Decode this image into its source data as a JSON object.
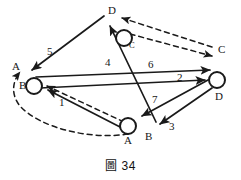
{
  "figure": {
    "caption_symbol": "圖",
    "caption_number": "34",
    "background_color": "#ffffff",
    "ink_color": "#1a1a1a"
  },
  "nodes": [
    {
      "id": "n-left",
      "label": "B",
      "secondary_label": "A",
      "x": 34,
      "y": 86,
      "r": 8
    },
    {
      "id": "n-top",
      "label": "C",
      "secondary_label": "D",
      "x": 124,
      "y": 39,
      "r": 8
    },
    {
      "id": "n-right",
      "label": "D",
      "secondary_label": "C",
      "x": 217,
      "y": 80,
      "r": 8
    },
    {
      "id": "n-bottom",
      "label": "A",
      "secondary_label": "B",
      "x": 128,
      "y": 126,
      "r": 8
    }
  ],
  "vertex_labels": [
    {
      "name": "label-A-left",
      "text": "A",
      "x": 12,
      "y": 61
    },
    {
      "name": "label-B-left",
      "text": "B",
      "x": 19,
      "y": 80
    },
    {
      "name": "label-D-top",
      "text": "D",
      "x": 108,
      "y": 5
    },
    {
      "name": "label-C-top",
      "text": "C",
      "x": 129,
      "y": 41,
      "small": true
    },
    {
      "name": "label-C-right",
      "text": "C",
      "x": 218,
      "y": 44
    },
    {
      "name": "label-D-right",
      "text": "D",
      "x": 215,
      "y": 91
    },
    {
      "name": "label-A-bottom",
      "text": "A",
      "x": 124,
      "y": 135
    },
    {
      "name": "label-B-bottom",
      "text": "B",
      "x": 145,
      "y": 131
    }
  ],
  "edge_labels": [
    {
      "name": "edge-label-5",
      "text": "5",
      "x": 47,
      "y": 46
    },
    {
      "name": "edge-label-4",
      "text": "4",
      "x": 105,
      "y": 57
    },
    {
      "name": "edge-label-6",
      "text": "6",
      "x": 148,
      "y": 59
    },
    {
      "name": "edge-label-2",
      "text": "2",
      "x": 177,
      "y": 72
    },
    {
      "name": "edge-label-7",
      "text": "7",
      "x": 152,
      "y": 94
    },
    {
      "name": "edge-label-3",
      "text": "3",
      "x": 169,
      "y": 121
    },
    {
      "name": "edge-label-1",
      "text": "1",
      "x": 59,
      "y": 97
    }
  ],
  "edges": [
    {
      "name": "edge-solid-top-to-left",
      "style": "solid",
      "weight": "5"
    },
    {
      "name": "edge-solid-bottom-to-top",
      "style": "solid",
      "weight": "4"
    },
    {
      "name": "edge-solid-left-to-right",
      "style": "solid",
      "weight": "6"
    },
    {
      "name": "edge-solid-left-to-right-2",
      "style": "solid",
      "weight": "2"
    },
    {
      "name": "edge-solid-right-to-bottom",
      "style": "solid",
      "weight": "7"
    },
    {
      "name": "edge-solid-right-to-lower",
      "style": "solid",
      "weight": "3"
    },
    {
      "name": "edge-solid-bottom-to-left",
      "style": "solid",
      "weight": "1"
    },
    {
      "name": "edge-dashed-top-to-right",
      "style": "dashed",
      "weight": ""
    },
    {
      "name": "edge-dashed-right-to-top",
      "style": "dashed",
      "weight": ""
    },
    {
      "name": "edge-dashed-bottom-to-left",
      "style": "dashed",
      "weight": ""
    },
    {
      "name": "edge-dashed-left-curve",
      "style": "dashed",
      "weight": ""
    }
  ]
}
